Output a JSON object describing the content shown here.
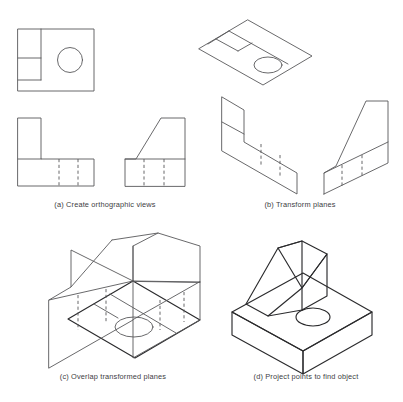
{
  "figure": {
    "background_color": "#ffffff",
    "line_color": "#58585a",
    "object_line_color": "#2b2b2d",
    "hidden_line_style": "dashed",
    "panel_count": 4
  },
  "panels": [
    {
      "id": "a",
      "caption": "(a) Create orthographic views",
      "caption_x": 105,
      "caption_y": 207,
      "description": "Three orthographic views: top view with circular hole, front L-shaped view, right side view with inclined face",
      "views": [
        {
          "name": "top-view",
          "shape": "square-with-circle-and-notch"
        },
        {
          "name": "front-view",
          "shape": "L-shape-with-hidden-lines"
        },
        {
          "name": "side-view",
          "shape": "inclined-face-with-hidden-lines"
        }
      ]
    },
    {
      "id": "b",
      "caption": "(b) Transform planes",
      "caption_x": 300,
      "caption_y": 207,
      "description": "Each orthographic view sheared onto its isometric plane",
      "views": [
        {
          "name": "top-plane",
          "shape": "isometric-horizontal-plane"
        },
        {
          "name": "front-plane",
          "shape": "isometric-left-plane"
        },
        {
          "name": "side-plane",
          "shape": "isometric-right-plane"
        }
      ]
    },
    {
      "id": "c",
      "caption": "(c) Overlap transformed planes",
      "caption_x": 113,
      "caption_y": 379,
      "description": "The three transformed planes intersected in a common isometric space",
      "views": [
        {
          "name": "overlapped-planes",
          "shape": "intersecting-isometric-planes"
        }
      ]
    },
    {
      "id": "d",
      "caption": "(d) Project points to find object",
      "caption_x": 306,
      "caption_y": 379,
      "description": "Resulting solid: rectangular base with through hole and inclined vertical fin",
      "views": [
        {
          "name": "finished-object",
          "shape": "solid-isometric-object"
        }
      ]
    }
  ]
}
